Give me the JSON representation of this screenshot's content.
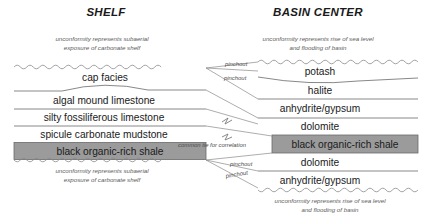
{
  "figure": {
    "type": "stratigraphic-cross-section",
    "background_color": "#ffffff",
    "shale_fill_color": "#9b9b9b",
    "line_color": "#6a6a6a"
  },
  "columns": {
    "shelf": {
      "title": "SHELF",
      "top_caption_line1": "unconformity represents subaerial",
      "top_caption_line2": "exposure of carbonate shelf",
      "bottom_caption_line1": "unconformity represents subaerial",
      "bottom_caption_line2": "exposure of carbonate shelf",
      "units": [
        {
          "name": "cap facies",
          "highlighted": false
        },
        {
          "name": "algal mound limestone",
          "highlighted": false
        },
        {
          "name": "silty fossiliferous limestone",
          "highlighted": false
        },
        {
          "name": "spicule carbonate mudstone",
          "highlighted": false
        },
        {
          "name": "black organic-rich shale",
          "highlighted": true
        }
      ]
    },
    "basin_center": {
      "title": "BASIN CENTER",
      "top_caption_line1": "unconformity represents rise of sea level",
      "top_caption_line2": "and flooding of basin",
      "bottom_caption_line1": "unconformity represents rise of sea level",
      "bottom_caption_line2": "and flooding of basin",
      "units": [
        {
          "name": "potash",
          "highlighted": false
        },
        {
          "name": "halite",
          "highlighted": false
        },
        {
          "name": "anhydrite/gypsum",
          "highlighted": false
        },
        {
          "name": "dolomite",
          "highlighted": false
        },
        {
          "name": "black organic-rich shale",
          "highlighted": true
        },
        {
          "name": "dolomite",
          "highlighted": false
        },
        {
          "name": "anhydrite/gypsum",
          "highlighted": false
        }
      ]
    }
  },
  "annotations": {
    "pinchout_upper_1": "pinchout",
    "pinchout_upper_2": "pinchout",
    "common_tie": "common tie for correlation",
    "pinchout_lower_1": "pinchout",
    "pinchout_lower_2": "pinchout"
  }
}
